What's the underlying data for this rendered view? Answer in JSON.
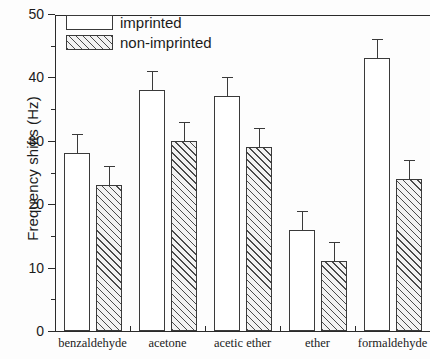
{
  "chart_data": {
    "type": "bar",
    "title": "",
    "xlabel": "",
    "ylabel": "Frequency shifts (Hz)",
    "ylim": [
      0,
      50
    ],
    "ytick_major": [
      0,
      10,
      20,
      30,
      40,
      50
    ],
    "ytick_minor": [
      5,
      15,
      25,
      35,
      45
    ],
    "ytick_labels": [
      "0",
      "10",
      "20",
      "30",
      "40",
      "50"
    ],
    "grid": false,
    "legend_position": "top-left",
    "categories": [
      "benzaldehyde",
      "acetone",
      "acetic ether",
      "ether",
      "formaldehyde"
    ],
    "series": [
      {
        "name": "imprinted",
        "fill": "open",
        "values": [
          28,
          38,
          37,
          16,
          43
        ],
        "errors": [
          3,
          3,
          3,
          3,
          3
        ]
      },
      {
        "name": "non-imprinted",
        "fill": "hatched",
        "values": [
          23,
          30,
          29,
          11,
          24
        ],
        "errors": [
          3,
          3,
          3,
          3,
          3
        ]
      }
    ]
  },
  "legend": {
    "items": [
      {
        "label": "imprinted",
        "swatch": "open-rectangle"
      },
      {
        "label": "non-imprinted",
        "swatch": "hatched-rectangle"
      }
    ]
  },
  "colors": {
    "axis": "#2a2a2a",
    "bar_outline": "#3a3a3a",
    "hatch": "#4a4a4a",
    "background": "#fdfdfd",
    "text": "#1b1b1b"
  }
}
